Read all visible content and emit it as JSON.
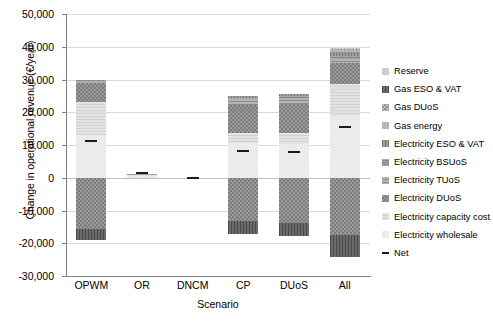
{
  "chart_data": {
    "type": "bar",
    "subtype": "stacked-bar-with-net-markers",
    "title": "",
    "xlabel": "Scenario",
    "ylabel": "Change in operational revenue (€/year)",
    "ylim": [
      -30000,
      50000
    ],
    "ytick_step": 10000,
    "ytick_labels": [
      "50,000",
      "40,000",
      "30,000",
      "20,000",
      "10,000",
      "0",
      "-10,000",
      "-20,000",
      "-30,000"
    ],
    "ytick_values": [
      50000,
      40000,
      30000,
      20000,
      10000,
      0,
      -10000,
      -20000,
      -30000
    ],
    "grid": true,
    "legend_position": "right",
    "categories": [
      "OPWM",
      "OR",
      "DNCM",
      "CP",
      "DUoS",
      "All"
    ],
    "series": [
      {
        "name": "Electricity wholesale",
        "key": "wholesale",
        "values": [
          13000,
          700,
          -60,
          10700,
          10400,
          18900
        ]
      },
      {
        "name": "Electricity capacity cost",
        "key": "capacity",
        "values": [
          10000,
          200,
          0,
          3000,
          3400,
          9600
        ]
      },
      {
        "name": "Electricity DUoS",
        "key": "eduos",
        "values": [
          5800,
          250,
          0,
          8600,
          8700,
          6500
        ]
      },
      {
        "name": "Electricity TUoS",
        "key": "etuos",
        "values": [
          400,
          60,
          0,
          1700,
          1900,
          1300
        ]
      },
      {
        "name": "Electricity BSUoS",
        "key": "ebsuos",
        "values": [
          300,
          40,
          0,
          500,
          600,
          900
        ]
      },
      {
        "name": "Electricity ESO & VAT",
        "key": "eeso",
        "values": [
          300,
          40,
          0,
          500,
          600,
          1200
        ]
      },
      {
        "name": "Gas energy",
        "key": "gasenergy",
        "values": [
          0,
          0,
          0,
          0,
          0,
          600
        ]
      },
      {
        "name": "Gas DUoS",
        "key": "gasduos",
        "values": [
          0,
          0,
          0,
          0,
          0,
          300
        ]
      },
      {
        "name": "Gas ESO & VAT",
        "key": "gaseso",
        "values": [
          0,
          0,
          0,
          0,
          0,
          200
        ]
      },
      {
        "name": "Reserve",
        "key": "reserve",
        "values": [
          0,
          0,
          0,
          0,
          0,
          200
        ]
      },
      {
        "name": "Electricity DUoS (negative)",
        "key": "eduos_neg",
        "values": [
          -15700,
          0,
          0,
          -13200,
          -13700,
          -17500
        ]
      },
      {
        "name": "Gas ESO & VAT (negative)",
        "key": "gaseso_neg",
        "values": [
          -3300,
          0,
          0,
          -4000,
          -4100,
          -6700
        ]
      }
    ],
    "net": {
      "name": "Net",
      "values": [
        11300,
        1300,
        -60,
        8200,
        7900,
        15500
      ]
    },
    "bar_totals_positive": [
      29800,
      1300,
      0,
      25000,
      25600,
      39700
    ],
    "bar_totals_negative": [
      -19000,
      0,
      -60,
      -17200,
      -17800,
      -24200
    ]
  },
  "legend": {
    "items": [
      {
        "label": "Reserve",
        "swatch": "reserve-swatch",
        "fill": "p-reserve"
      },
      {
        "label": "Gas ESO & VAT",
        "swatch": "gas-eso-vat-swatch",
        "fill": "p-gaseso"
      },
      {
        "label": "Gas DUoS",
        "swatch": "gas-duos-swatch",
        "fill": "p-gasduos"
      },
      {
        "label": "Gas energy",
        "swatch": "gas-energy-swatch",
        "fill": "p-gasenergy"
      },
      {
        "label": "Electricity ESO & VAT",
        "swatch": "electricity-eso-vat-swatch",
        "fill": "p-eeso"
      },
      {
        "label": "Electricity BSUoS",
        "swatch": "electricity-bsuos-swatch",
        "fill": "p-ebsuos"
      },
      {
        "label": "Electricity TUoS",
        "swatch": "electricity-tuos-swatch",
        "fill": "p-etuos"
      },
      {
        "label": "Electricity DUoS",
        "swatch": "electricity-duos-swatch",
        "fill": "p-edupos"
      },
      {
        "label": "Electricity capacity cost",
        "swatch": "electricity-capacity-cost-swatch",
        "fill": "p-capacity"
      },
      {
        "label": "Electricity wholesale",
        "swatch": "electricity-wholesale-swatch",
        "fill": "p-wholesale"
      },
      {
        "label": "Net",
        "swatch": "net-marker-swatch",
        "fill": "net"
      }
    ]
  },
  "colors": {
    "gridline": "#d9d9d9",
    "axis": "#7f7f7f",
    "net_marker": "#1a1a1a",
    "background": "#ffffff"
  }
}
